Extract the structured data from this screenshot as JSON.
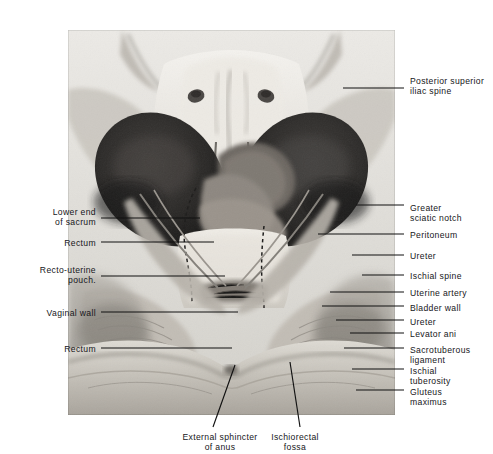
{
  "figure": {
    "kind": "anatomical-photograph",
    "title_visible": false,
    "palette": {
      "page_background": "#ffffff",
      "photo_base": "#d8d7d3",
      "bone_light": "#f1efea",
      "cavity_dark": "#3c3a39",
      "cavity_deep": "#232221",
      "midtone": "#9a9792",
      "leader_line": "#111111",
      "label_text": "#16161a"
    },
    "photo_frame": {
      "left": 68,
      "top": 30,
      "width": 327,
      "height": 385
    }
  },
  "labels_right": [
    {
      "id": "posterior-superior-iliac-spine",
      "lines": [
        "Posterior superior",
        "iliac spine"
      ],
      "text_x": 410,
      "text_y": 76,
      "leader_y": 88,
      "leader_x_start": 343,
      "leader_x_end": 404
    },
    {
      "id": "greater-sciatic-notch",
      "lines": [
        "Greater",
        "sciatic notch"
      ],
      "text_x": 410,
      "text_y": 203,
      "leader_y": 205,
      "leader_x_start": 356,
      "leader_x_end": 404
    },
    {
      "id": "peritoneum",
      "lines": [
        "Peritoneum"
      ],
      "text_x": 410,
      "text_y": 230,
      "leader_y": 234,
      "leader_x_start": 318,
      "leader_x_end": 404
    },
    {
      "id": "ureter-upper",
      "lines": [
        "Ureter"
      ],
      "text_x": 410,
      "text_y": 251,
      "leader_y": 255,
      "leader_x_start": 352,
      "leader_x_end": 404
    },
    {
      "id": "ischial-spine",
      "lines": [
        "Ischial spine"
      ],
      "text_x": 410,
      "text_y": 271,
      "leader_y": 275,
      "leader_x_start": 362,
      "leader_x_end": 404
    },
    {
      "id": "uterine-artery",
      "lines": [
        "Uterine artery"
      ],
      "text_x": 410,
      "text_y": 288,
      "leader_y": 292,
      "leader_x_start": 330,
      "leader_x_end": 404
    },
    {
      "id": "bladder-wall",
      "lines": [
        "Bladder wall"
      ],
      "text_x": 410,
      "text_y": 303,
      "leader_y": 306,
      "leader_x_start": 322,
      "leader_x_end": 404
    },
    {
      "id": "ureter-lower",
      "lines": [
        "Ureter"
      ],
      "text_x": 410,
      "text_y": 317,
      "leader_y": 320,
      "leader_x_start": 336,
      "leader_x_end": 404
    },
    {
      "id": "levator-ani",
      "lines": [
        "Levator ani"
      ],
      "text_x": 410,
      "text_y": 329,
      "leader_y": 333,
      "leader_x_start": 350,
      "leader_x_end": 404
    },
    {
      "id": "sacrotuberous-ligament",
      "lines": [
        "Sacrotuberous",
        "ligament"
      ],
      "text_x": 410,
      "text_y": 345,
      "leader_y": 348,
      "leader_x_start": 344,
      "leader_x_end": 404
    },
    {
      "id": "ischial-tuberosity",
      "lines": [
        "Ischial",
        "tuberosity"
      ],
      "text_x": 410,
      "text_y": 366,
      "leader_y": 369,
      "leader_x_start": 352,
      "leader_x_end": 404
    },
    {
      "id": "gluteus-maximus",
      "lines": [
        "Gluteus",
        "maximus"
      ],
      "text_x": 410,
      "text_y": 387,
      "leader_y": 390,
      "leader_x_start": 356,
      "leader_x_end": 404
    }
  ],
  "labels_left": [
    {
      "id": "lower-end-of-sacrum",
      "lines": [
        "Lower end",
        "of sacrum"
      ],
      "text_x": 96,
      "text_y": 207,
      "leader_y": 218,
      "leader_x_start": 101,
      "leader_x_end": 200
    },
    {
      "id": "rectum-upper",
      "lines": [
        "Rectum"
      ],
      "text_x": 96,
      "text_y": 238,
      "leader_y": 242,
      "leader_x_start": 101,
      "leader_x_end": 214
    },
    {
      "id": "recto-uterine-pouch",
      "lines": [
        "Recto-uterine",
        "pouch."
      ],
      "text_x": 96,
      "text_y": 265,
      "leader_y": 276,
      "leader_x_start": 101,
      "leader_x_end": 225
    },
    {
      "id": "vaginal-wall",
      "lines": [
        "Vaginal wall"
      ],
      "text_x": 96,
      "text_y": 308,
      "leader_y": 312,
      "leader_x_start": 101,
      "leader_x_end": 238
    },
    {
      "id": "rectum-lower",
      "lines": [
        "Rectum"
      ],
      "text_x": 96,
      "text_y": 344,
      "leader_y": 348,
      "leader_x_start": 101,
      "leader_x_end": 232
    }
  ],
  "labels_bottom": [
    {
      "id": "external-sphincter-of-anus",
      "lines": [
        "External sphincter",
        "of anus"
      ],
      "text_x": 220,
      "text_y": 432,
      "leader": {
        "x1": 235,
        "y1": 365,
        "x2": 213,
        "y2": 427
      }
    },
    {
      "id": "ischiorectal-fossa",
      "lines": [
        "Ischiorectal",
        "fossa"
      ],
      "text_x": 295,
      "text_y": 432,
      "leader": {
        "x1": 290,
        "y1": 362,
        "x2": 300,
        "y2": 427
      }
    }
  ]
}
